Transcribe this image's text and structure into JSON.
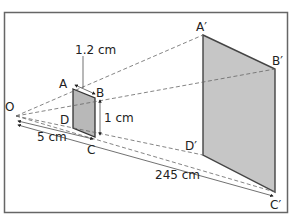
{
  "diagram": {
    "type": "perspective projection / enlargement",
    "center": {
      "label": "O",
      "x": 16,
      "y": 116
    },
    "small_shape": {
      "vertices": [
        {
          "label": "A",
          "x": 73,
          "y": 89
        },
        {
          "label": "B",
          "x": 95,
          "y": 98
        },
        {
          "label": "C",
          "x": 95,
          "y": 137
        },
        {
          "label": "D",
          "x": 73,
          "y": 128
        }
      ],
      "fill": "#bdbdbd"
    },
    "large_shape": {
      "vertices": [
        {
          "label": "A′",
          "x": 203,
          "y": 35
        },
        {
          "label": "B′",
          "x": 275,
          "y": 69
        },
        {
          "label": "C′",
          "x": 275,
          "y": 192
        },
        {
          "label": "D′",
          "x": 203,
          "y": 155
        }
      ],
      "fill": "#c8c8c8"
    },
    "measurements": {
      "ab_width": "1.2 cm",
      "bc_height": "1 cm",
      "oc_distance": "5 cm",
      "oc_prime_distance": "245 cm"
    },
    "labels": {
      "O": "O",
      "A": "A",
      "B": "B",
      "C": "C",
      "D": "D",
      "A_prime": "A′",
      "B_prime": "B′",
      "C_prime": "C′",
      "D_prime": "D′"
    },
    "colors": {
      "frame": "#555555",
      "line": "#333333",
      "dashed": "#555555"
    }
  }
}
